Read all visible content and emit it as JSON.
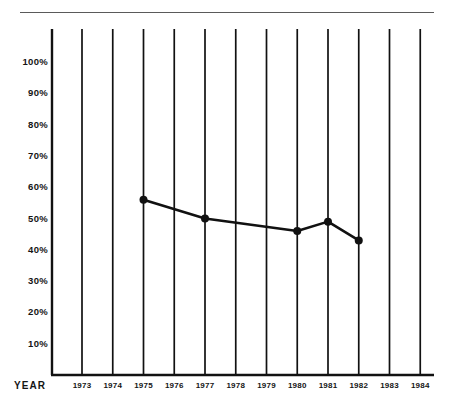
{
  "chart_data": {
    "type": "line",
    "title": "",
    "subtitle": "",
    "xlabel": "YEAR",
    "ylabel": "",
    "categories": [
      "1973",
      "1974",
      "1975",
      "1976",
      "1977",
      "1978",
      "1979",
      "1980",
      "1981",
      "1982",
      "1983",
      "1984"
    ],
    "x": [
      1973,
      1974,
      1975,
      1976,
      1977,
      1978,
      1979,
      1980,
      1981,
      1982,
      1983,
      1984
    ],
    "ytick_labels": [
      "100%",
      "90%",
      "80%",
      "70%",
      "60%",
      "50%",
      "40%",
      "30%",
      "20%",
      "10%"
    ],
    "ytick_values": [
      100,
      90,
      80,
      70,
      60,
      50,
      40,
      30,
      20,
      10
    ],
    "ylim": [
      0,
      110
    ],
    "xlim": [
      1973,
      1984
    ],
    "grid": "vertical",
    "legend": "none",
    "series": [
      {
        "name": "Percent",
        "marker": "filled-circle",
        "line_color": "#111111",
        "points": [
          {
            "x": 1975,
            "y": 56,
            "label": "56%",
            "marker": true
          },
          {
            "x": 1977,
            "y": 50,
            "label": "50%",
            "marker": true
          },
          {
            "x": 1980,
            "y": 46,
            "label": "46%",
            "marker": true
          },
          {
            "x": 1981,
            "y": 49,
            "label": "49%",
            "marker": true
          },
          {
            "x": 1982,
            "y": 43,
            "label": "43%",
            "marker": true
          }
        ],
        "values": [
          null,
          null,
          56,
          null,
          50,
          null,
          null,
          46,
          49,
          43,
          null,
          null
        ]
      }
    ],
    "annotations": []
  },
  "figure": {
    "background_color": "#ffffff",
    "ink_color": "#111111",
    "rule_color": "#5a5a5a",
    "top_rule": true
  },
  "axes": {
    "x_title": "YEAR",
    "y_title": ""
  }
}
